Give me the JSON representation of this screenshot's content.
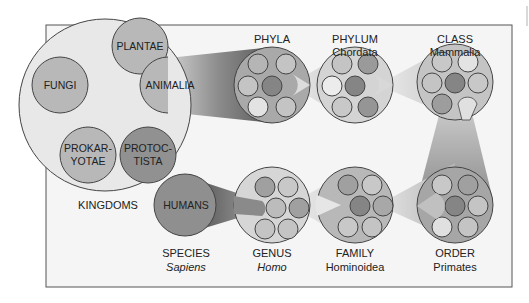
{
  "colors": {
    "frame_bg": "#f4f4f4",
    "frame_border": "#555555",
    "big_circle_fill": "#e6e6e6",
    "kingdom_light": "#b9b9b9",
    "kingdom_dark": "#8f8f8f",
    "group_fill": "#a9a9a9",
    "dot_dark": "#858585",
    "dot_mid": "#a3a3a3",
    "dot_light": "#c4c4c4",
    "dot_lighter": "#dedede",
    "stroke": "#444444"
  },
  "kingdoms": {
    "label": "KINGDOMS",
    "items": [
      {
        "name": "PLANTAE",
        "line1": "PLANTAE",
        "line2": ""
      },
      {
        "name": "FUNGI",
        "line1": "FUNGI",
        "line2": ""
      },
      {
        "name": "ANIMALIA",
        "line1": "ANIMALIA",
        "line2": ""
      },
      {
        "name": "PROKARYOTAE",
        "line1": "PROKAR-",
        "line2": "YOTAE"
      },
      {
        "name": "PROTOCTISTA",
        "line1": "PROTOC-",
        "line2": "TISTA"
      }
    ]
  },
  "ranks": [
    {
      "rank": "PHYLA",
      "name": ""
    },
    {
      "rank": "PHYLUM",
      "name": "Chordata"
    },
    {
      "rank": "CLASS",
      "name": "Mammalia"
    },
    {
      "rank": "ORDER",
      "name": "Primates"
    },
    {
      "rank": "FAMILY",
      "name": "Hominoidea"
    },
    {
      "rank": "GENUS",
      "name": "Homo"
    },
    {
      "rank": "SPECIES",
      "name": "Sapiens"
    }
  ],
  "species_circle_label": "HUMANS"
}
